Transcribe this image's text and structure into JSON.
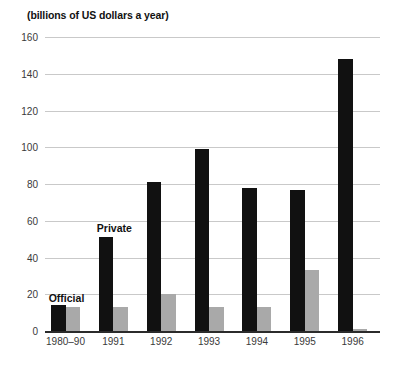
{
  "chart_data": {
    "type": "bar",
    "title": "(billions of US dollars a year)",
    "xlabel": "",
    "ylabel": "",
    "ylim": [
      0,
      160
    ],
    "ytick_step": 20,
    "yticks": [
      0,
      20,
      40,
      60,
      80,
      100,
      120,
      140,
      160
    ],
    "grid": true,
    "legend_position": "inline-annotation",
    "categories": [
      "1980–90",
      "1991",
      "1992",
      "1993",
      "1994",
      "1995",
      "1996"
    ],
    "series": [
      {
        "name": "Private",
        "color": "#111111",
        "values": [
          14,
          51,
          81,
          99,
          78,
          77,
          148
        ]
      },
      {
        "name": "Official",
        "color": "#a9a9a9",
        "values": [
          13,
          13,
          20,
          13,
          13,
          33,
          1
        ]
      }
    ],
    "annotations": [
      {
        "text": "Official",
        "series": "Official",
        "category": "1980–90"
      },
      {
        "text": "Private",
        "series": "Private",
        "category": "1991"
      }
    ]
  }
}
